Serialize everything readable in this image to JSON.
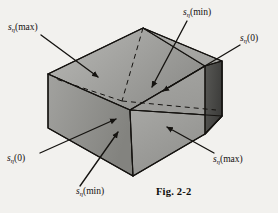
{
  "figure": {
    "caption": "Fig. 2-2",
    "background_color": "#f2f1ee",
    "ink_color": "#151310"
  },
  "labels": [
    {
      "id": "top-left",
      "symbol": "s",
      "subscript": "η",
      "argument": "(max)",
      "text": "sη(max)",
      "position": "upper-left",
      "arrow": {
        "from": [
          42,
          36
        ],
        "to": [
          96,
          76
        ]
      }
    },
    {
      "id": "top-mid",
      "symbol": "s",
      "subscript": "η",
      "argument": "(min)",
      "text": "sη(min)",
      "position": "upper-middle",
      "arrow": {
        "from": [
          186,
          22
        ],
        "to": [
          152,
          86
        ]
      }
    },
    {
      "id": "right-top",
      "symbol": "s",
      "subscript": "η",
      "argument": "(0)",
      "text": "sη(0)",
      "position": "upper-right",
      "arrow": {
        "from": [
          238,
          45
        ],
        "to": [
          163,
          90
        ]
      }
    },
    {
      "id": "bot-left",
      "symbol": "s",
      "subscript": "η",
      "argument": "(0)",
      "text": "sη(0)",
      "position": "lower-left",
      "arrow": {
        "from": [
          41,
          152
        ],
        "to": [
          114,
          120
        ]
      }
    },
    {
      "id": "bot-mid",
      "symbol": "s",
      "subscript": "η",
      "argument": "(min)",
      "text": "sη(min)",
      "position": "lower-middle",
      "arrow": {
        "from": [
          81,
          185
        ],
        "to": [
          117,
          133
        ]
      }
    },
    {
      "id": "right-bot",
      "symbol": "s",
      "subscript": "η",
      "argument": "(max)",
      "text": "sη(max)",
      "position": "lower-right",
      "arrow": {
        "from": [
          212,
          152
        ],
        "to": [
          168,
          126
        ]
      }
    }
  ],
  "cube": {
    "vertices": {
      "top": [
        143,
        28
      ],
      "left_upper": [
        48,
        74
      ],
      "right_upper": [
        222,
        61
      ],
      "center_front": [
        130,
        110
      ],
      "left_lower": [
        48,
        128
      ],
      "right_lower": [
        222,
        116
      ],
      "bottom": [
        133,
        176
      ]
    },
    "faces": [
      {
        "name": "top-left-face",
        "shade": "#9c9c99"
      },
      {
        "name": "top-right-face",
        "shade": "#a8a8a4"
      },
      {
        "name": "front-left-face",
        "shade": "#8e8e8b"
      },
      {
        "name": "front-low-face",
        "shade": "#9a9a97"
      },
      {
        "name": "right-dark-face",
        "shade": "#4e4e4c"
      }
    ]
  }
}
